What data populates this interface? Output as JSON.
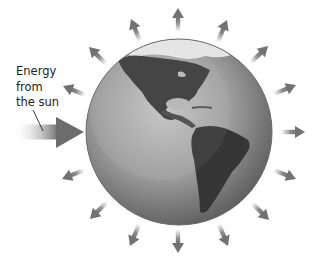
{
  "diagram": {
    "label": {
      "lines": [
        "Energy",
        "from",
        "the sun"
      ]
    },
    "incoming_arrow": {
      "name": "incoming-solar-energy",
      "color": "#6e6e6e"
    },
    "outgoing_arrows": {
      "count": 15,
      "color": "#7a7a7a"
    },
    "globe": {
      "view": "Western Hemisphere (North and South America)",
      "ocean_color": "#9a9a9a",
      "land_color": "#3a3a3a",
      "ice_color": "#e6e6e6"
    }
  }
}
